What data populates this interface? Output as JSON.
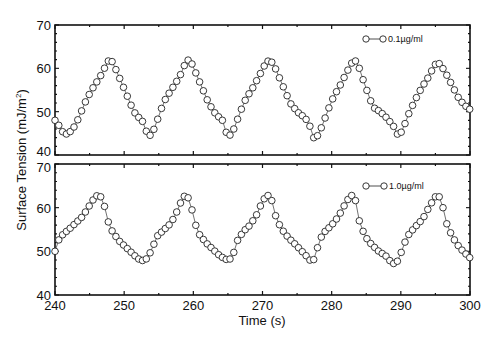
{
  "chart_data": {
    "type": "scatter",
    "title": "",
    "xlabel": "Time (s)",
    "ylabel": "Surface Tension (mJ/m²)",
    "xlim": [
      240,
      300
    ],
    "x_ticks": [
      240,
      250,
      260,
      270,
      280,
      290,
      300
    ],
    "grid": false,
    "panels": [
      {
        "name": "0.1µg/ml",
        "legend": "0.1µg/ml",
        "legend_position": "upper right",
        "ylim": [
          40,
          70
        ],
        "y_ticks": [
          40,
          50,
          60,
          70
        ],
        "keypoints": [
          [
            240.0,
            48.0
          ],
          [
            240.5,
            47.0
          ],
          [
            241.0,
            45.5
          ],
          [
            241.6,
            44.8
          ],
          [
            242.3,
            45.5
          ],
          [
            243.0,
            47.0
          ],
          [
            243.8,
            50.0
          ],
          [
            244.6,
            53.0
          ],
          [
            245.5,
            55.5
          ],
          [
            246.5,
            58.0
          ],
          [
            247.3,
            60.5
          ],
          [
            247.8,
            62.0
          ],
          [
            248.3,
            61.5
          ],
          [
            249.0,
            59.0
          ],
          [
            249.8,
            56.0
          ],
          [
            250.6,
            53.0
          ],
          [
            251.4,
            50.0
          ],
          [
            252.2,
            48.5
          ],
          [
            252.8,
            47.5
          ],
          [
            253.3,
            45.0
          ],
          [
            253.8,
            44.5
          ],
          [
            254.5,
            46.5
          ],
          [
            255.2,
            50.0
          ],
          [
            256.0,
            53.0
          ],
          [
            257.0,
            55.5
          ],
          [
            258.0,
            58.0
          ],
          [
            258.8,
            61.0
          ],
          [
            259.3,
            62.0
          ],
          [
            259.8,
            61.0
          ],
          [
            260.6,
            58.0
          ],
          [
            261.4,
            55.0
          ],
          [
            262.2,
            52.0
          ],
          [
            263.2,
            49.5
          ],
          [
            264.2,
            48.0
          ],
          [
            264.8,
            45.0
          ],
          [
            265.4,
            44.5
          ],
          [
            266.0,
            46.5
          ],
          [
            266.8,
            50.0
          ],
          [
            267.6,
            53.0
          ],
          [
            268.6,
            55.5
          ],
          [
            269.6,
            58.5
          ],
          [
            270.4,
            61.0
          ],
          [
            271.0,
            62.0
          ],
          [
            271.6,
            61.0
          ],
          [
            272.4,
            58.0
          ],
          [
            273.2,
            55.0
          ],
          [
            274.0,
            52.0
          ],
          [
            275.0,
            50.0
          ],
          [
            276.2,
            48.5
          ],
          [
            276.9,
            46.5
          ],
          [
            277.4,
            44.0
          ],
          [
            278.0,
            44.5
          ],
          [
            278.7,
            47.0
          ],
          [
            279.5,
            50.5
          ],
          [
            280.3,
            53.5
          ],
          [
            281.2,
            56.0
          ],
          [
            282.0,
            58.5
          ],
          [
            282.8,
            61.0
          ],
          [
            283.3,
            62.0
          ],
          [
            283.8,
            61.0
          ],
          [
            284.3,
            58.5
          ],
          [
            285.3,
            54.0
          ],
          [
            286.0,
            51.0
          ],
          [
            287.0,
            50.0
          ],
          [
            288.0,
            48.5
          ],
          [
            289.0,
            46.5
          ],
          [
            289.6,
            44.5
          ],
          [
            290.2,
            45.5
          ],
          [
            291.0,
            49.0
          ],
          [
            292.0,
            52.5
          ],
          [
            293.0,
            55.5
          ],
          [
            294.0,
            58.0
          ],
          [
            294.8,
            60.5
          ],
          [
            295.3,
            61.5
          ],
          [
            295.9,
            60.5
          ],
          [
            296.8,
            58.0
          ],
          [
            297.6,
            55.5
          ],
          [
            298.4,
            53.0
          ],
          [
            299.2,
            51.5
          ],
          [
            300.0,
            50.5
          ]
        ]
      },
      {
        "name": "1.0µg/ml",
        "legend": "1.0µg/ml",
        "legend_position": "upper right",
        "ylim": [
          40,
          70
        ],
        "y_ticks": [
          40,
          50,
          60,
          70
        ],
        "keypoints": [
          [
            240.0,
            50.0
          ],
          [
            240.5,
            52.5
          ],
          [
            241.2,
            54.0
          ],
          [
            242.0,
            55.0
          ],
          [
            243.0,
            56.5
          ],
          [
            244.0,
            58.0
          ],
          [
            245.0,
            60.5
          ],
          [
            245.8,
            62.5
          ],
          [
            246.4,
            63.0
          ],
          [
            247.0,
            61.5
          ],
          [
            247.5,
            57.5
          ],
          [
            248.3,
            54.5
          ],
          [
            249.2,
            52.5
          ],
          [
            250.2,
            51.0
          ],
          [
            251.2,
            49.5
          ],
          [
            252.0,
            48.3
          ],
          [
            252.8,
            47.8
          ],
          [
            253.4,
            48.5
          ],
          [
            254.0,
            50.5
          ],
          [
            254.8,
            53.5
          ],
          [
            255.8,
            55.0
          ],
          [
            256.8,
            56.5
          ],
          [
            257.6,
            59.0
          ],
          [
            258.4,
            62.0
          ],
          [
            258.9,
            63.0
          ],
          [
            259.6,
            61.5
          ],
          [
            260.0,
            57.5
          ],
          [
            260.8,
            54.0
          ],
          [
            261.8,
            52.0
          ],
          [
            262.8,
            50.5
          ],
          [
            263.8,
            49.0
          ],
          [
            264.6,
            48.2
          ],
          [
            265.2,
            48.0
          ],
          [
            265.8,
            49.5
          ],
          [
            266.4,
            52.5
          ],
          [
            267.2,
            54.5
          ],
          [
            268.2,
            56.0
          ],
          [
            269.2,
            58.5
          ],
          [
            270.0,
            61.5
          ],
          [
            270.7,
            63.0
          ],
          [
            271.4,
            61.5
          ],
          [
            272.0,
            57.5
          ],
          [
            272.8,
            55.0
          ],
          [
            273.8,
            53.0
          ],
          [
            274.8,
            51.5
          ],
          [
            276.0,
            49.5
          ],
          [
            276.6,
            48.5
          ],
          [
            277.1,
            47.5
          ],
          [
            277.6,
            48.5
          ],
          [
            278.2,
            52.5
          ],
          [
            279.0,
            54.5
          ],
          [
            280.0,
            56.0
          ],
          [
            281.0,
            58.0
          ],
          [
            282.0,
            61.0
          ],
          [
            282.8,
            63.0
          ],
          [
            283.5,
            61.5
          ],
          [
            284.0,
            57.0
          ],
          [
            284.8,
            53.5
          ],
          [
            285.8,
            51.5
          ],
          [
            286.8,
            50.0
          ],
          [
            287.8,
            49.0
          ],
          [
            288.6,
            47.5
          ],
          [
            289.2,
            47.0
          ],
          [
            289.8,
            48.5
          ],
          [
            290.4,
            51.5
          ],
          [
            291.2,
            54.0
          ],
          [
            292.2,
            55.8
          ],
          [
            293.2,
            57.5
          ],
          [
            294.2,
            60.5
          ],
          [
            295.0,
            62.5
          ],
          [
            295.6,
            62.5
          ],
          [
            296.1,
            60.0
          ],
          [
            296.6,
            56.5
          ],
          [
            297.4,
            53.5
          ],
          [
            298.2,
            51.5
          ],
          [
            299.0,
            50.0
          ],
          [
            300.0,
            48.5
          ]
        ]
      }
    ]
  },
  "panels_layout": {
    "x_left_px": 55,
    "x_right_px": 470,
    "top_panel": {
      "y_top_px": 25,
      "y_bottom_px": 155
    },
    "bottom_panel": {
      "y_top_px": 164,
      "y_bottom_px": 295
    }
  },
  "labels": {
    "xlabel": "Time (s)",
    "ylabel_main": "Surface Tension (mJ/m",
    "ylabel_sup": "2",
    "ylabel_close": ")",
    "legend_top": "0.1µg/ml",
    "legend_bottom": "1.0µg/ml",
    "x_tick_labels": [
      "240",
      "250",
      "260",
      "270",
      "280",
      "290",
      "300"
    ],
    "top_y_tick_labels": [
      "70",
      "60",
      "50",
      "40"
    ],
    "bottom_y_tick_labels": [
      "70",
      "60",
      "50",
      "40"
    ]
  }
}
